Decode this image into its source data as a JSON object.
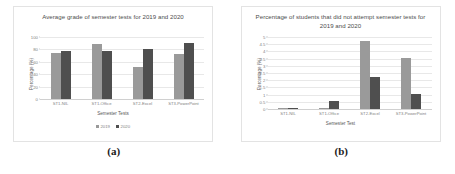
{
  "figure": {
    "panels": [
      {
        "caption": "(a)",
        "chart_data": {
          "type": "bar",
          "title": "Average grade of semester tests for 2019 and 2020",
          "xlabel": "Semester Tests",
          "ylabel": "Percentage (%)",
          "categories": [
            "ST1-NIL",
            "ST1-Office",
            "ST2-Excel",
            "ST3-PowerPoint"
          ],
          "series": [
            {
              "name": "2019",
              "color": "#9a9a9a",
              "values": [
                74,
                89,
                51,
                73
              ]
            },
            {
              "name": "2020",
              "color": "#4f4f4f",
              "values": [
                78,
                78,
                80,
                91
              ]
            }
          ],
          "ylim": [
            0,
            100
          ],
          "yticks": [
            0,
            20,
            40,
            60,
            80,
            100
          ],
          "ytick_labels": [
            "0",
            "20",
            "40",
            "60",
            "80",
            "100"
          ],
          "grid": true,
          "legend": true,
          "legend_position": "bottom"
        }
      },
      {
        "caption": "(b)",
        "chart_data": {
          "type": "bar",
          "title": "Percentage of students that did not attempt semester tests for 2019 and 2020",
          "xlabel": "Semester Test",
          "ylabel": "Percentage (%)",
          "categories": [
            "ST1-NIL",
            "ST1-Office",
            "ST2-Excel",
            "ST3-PowerPoint"
          ],
          "series": [
            {
              "name": "2019",
              "color": "#9a9a9a",
              "values": [
                0.05,
                0.1,
                4.7,
                3.55
              ]
            },
            {
              "name": "2020",
              "color": "#4f4f4f",
              "values": [
                0.08,
                0.55,
                2.2,
                1.05
              ]
            }
          ],
          "ylim": [
            0,
            5
          ],
          "yticks": [
            0,
            0.5,
            1,
            1.5,
            2,
            2.5,
            3,
            3.5,
            4,
            4.5,
            5
          ],
          "ytick_labels": [
            "0",
            "0.5",
            "1",
            "1.5",
            "2",
            "2.5",
            "3",
            "3.5",
            "4",
            "4.5",
            "5"
          ],
          "grid": true,
          "legend": false,
          "legend_position": "none"
        }
      }
    ]
  }
}
